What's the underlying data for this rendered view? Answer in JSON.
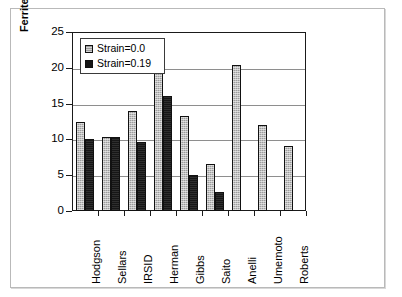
{
  "chart_data": {
    "type": "bar",
    "title": "",
    "xlabel": "",
    "ylabel": "Ferrite grain size in microns",
    "ylim": [
      0,
      25
    ],
    "yticks": [
      0,
      5,
      10,
      15,
      20,
      25
    ],
    "ytick_labels": [
      "0",
      "5",
      "10",
      "15",
      "20",
      "25"
    ],
    "grid": true,
    "legend_position": "upper-left-inside",
    "categories": [
      "Hodgson",
      "Sellars",
      "IRSID",
      "Herman",
      "Gibbs",
      "Saito",
      "Anelli",
      "Umemoto",
      "Roberts"
    ],
    "series": [
      {
        "name": "Strain=0.0",
        "color": "#9c9c9c",
        "values": [
          12.4,
          10.3,
          14.0,
          22.4,
          13.3,
          6.6,
          20.4,
          12.0,
          9.1
        ]
      },
      {
        "name": "Strain=0.19",
        "color": "#161616",
        "values": [
          10.0,
          10.3,
          9.6,
          16.0,
          5.0,
          2.7,
          null,
          null,
          null
        ]
      }
    ]
  },
  "legend": {
    "entries": [
      {
        "label": "Strain=0.0"
      },
      {
        "label": "Strain=0.19"
      }
    ]
  },
  "axes": {
    "y_title": "Ferrite grain size in microns"
  }
}
